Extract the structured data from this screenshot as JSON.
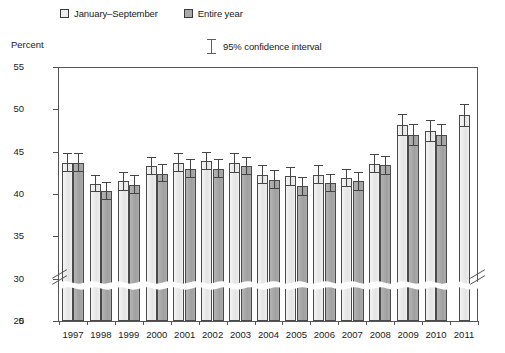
{
  "legend": {
    "items": [
      {
        "label": "January–September",
        "swatch": "light-gray-square",
        "color": "#ededed"
      },
      {
        "label": "Entire year",
        "swatch": "dark-gray-square",
        "color": "#a9a9a9"
      }
    ],
    "ci_label": "95% confidence interval"
  },
  "axes": {
    "ylabel": "Percent",
    "yticks": [
      "0",
      "25",
      "30",
      "35",
      "40",
      "45",
      "50",
      "55"
    ],
    "axis_break_between": [
      "0",
      "25"
    ]
  },
  "chart_data": {
    "type": "bar",
    "title": "",
    "subtitle": "",
    "xlabel": "",
    "ylabel": "Percent",
    "ylim": [
      25,
      55
    ],
    "ytick_values": [
      25,
      30,
      35,
      40,
      45,
      50,
      55
    ],
    "axis_break": true,
    "grid": false,
    "legend_position": "top-left",
    "error_bars": "95% confidence interval",
    "categories": [
      "1997",
      "1998",
      "1999",
      "2000",
      "2001",
      "2002",
      "2003",
      "2004",
      "2005",
      "2006",
      "2007",
      "2008",
      "2009",
      "2010",
      "2011"
    ],
    "series": [
      {
        "name": "January–September",
        "color": "#ededed",
        "values": [
          43.7,
          41.2,
          41.5,
          43.3,
          43.7,
          43.9,
          43.7,
          42.3,
          42.1,
          42.3,
          41.9,
          43.6,
          48.2,
          47.5,
          49.3
        ],
        "ci_lower": [
          42.6,
          40.2,
          40.4,
          42.3,
          42.6,
          42.8,
          42.5,
          41.2,
          41.0,
          41.2,
          40.8,
          42.5,
          46.9,
          46.2,
          47.9
        ],
        "ci_upper": [
          44.8,
          42.3,
          42.6,
          44.4,
          44.8,
          45.0,
          44.8,
          43.4,
          43.2,
          43.4,
          43.0,
          44.7,
          49.5,
          48.8,
          50.6
        ]
      },
      {
        "name": "Entire year",
        "color": "#a9a9a9",
        "values": [
          43.7,
          40.3,
          41.1,
          42.4,
          43.0,
          43.0,
          43.3,
          41.7,
          40.9,
          41.3,
          41.5,
          43.4,
          47.0,
          47.0,
          null
        ],
        "ci_lower": [
          42.6,
          39.3,
          40.0,
          41.4,
          41.9,
          41.9,
          42.2,
          40.6,
          39.8,
          40.2,
          40.4,
          42.3,
          45.7,
          45.7,
          null
        ],
        "ci_upper": [
          44.8,
          41.4,
          42.2,
          43.5,
          44.1,
          44.1,
          44.4,
          42.8,
          42.0,
          42.4,
          42.6,
          44.5,
          48.3,
          48.3,
          null
        ]
      }
    ]
  }
}
